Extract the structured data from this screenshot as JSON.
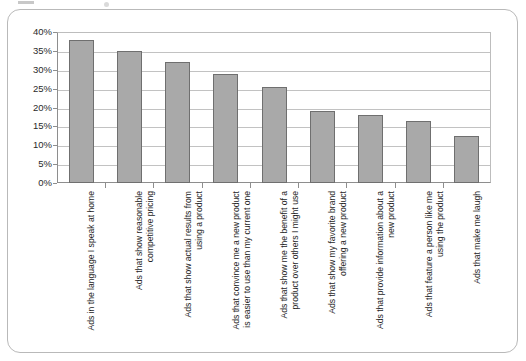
{
  "chart_data": {
    "type": "bar",
    "title": "",
    "subtitle": "",
    "xlabel": "",
    "ylabel": "",
    "ylim": [
      0,
      40
    ],
    "ytick_labels": [
      "40%",
      "35%",
      "30%",
      "25%",
      "20%",
      "15%",
      "10%",
      "5%",
      "0%"
    ],
    "ytick_values": [
      40,
      35,
      30,
      25,
      20,
      15,
      10,
      5,
      0
    ],
    "grid": true,
    "legend": "none",
    "orientation": "vertical",
    "value_unit": "%",
    "bar_color": "#a9a9a9",
    "bar_edge_color": "#6f6f6f",
    "grid_color": "#c2c2c2",
    "axis_color": "#8e8e8e",
    "categories": [
      "Ads in the language I speak at home",
      "Ads that show reasonable\ncompetitive pricing",
      "Ads that show actual results from\nusing a product",
      "Ads that convince me a new product\nis easier to use than my current one",
      "Ads that show me the benefit of a\nproduct over others I might use",
      "Ads that show my favorite brand\noffering a new product",
      "Ads that provide information about a\nnew product",
      "Ads that feature a person like me\nusing the product",
      "Ads that make me laugh"
    ],
    "values": [
      38,
      35,
      32,
      29,
      25.5,
      19,
      18,
      16.5,
      12.5
    ]
  }
}
